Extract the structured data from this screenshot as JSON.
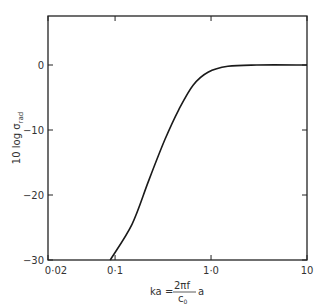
{
  "chart_data": {
    "type": "line",
    "title": "",
    "xlabel": "ka = (2πf / c0) a",
    "ylabel": "10 log σrad",
    "xscale": "log",
    "xlim": [
      0.02,
      10
    ],
    "ylim": [
      -30,
      7.5
    ],
    "grid": false,
    "legend": null,
    "x_ticks": [
      {
        "value": 0.02,
        "label": "0·02"
      },
      {
        "value": 0.1,
        "label": "0·1"
      },
      {
        "value": 1.0,
        "label": "1·0"
      },
      {
        "value": 10,
        "label": "10"
      }
    ],
    "y_ticks": [
      {
        "value": 0,
        "label": "0"
      },
      {
        "value": -10,
        "label": "-10"
      },
      {
        "value": -20,
        "label": "-20"
      },
      {
        "value": -30,
        "label": "-30"
      }
    ],
    "series": [
      {
        "name": "radiation efficiency",
        "x": [
          0.089,
          0.15,
          0.225,
          0.33,
          0.46,
          0.65,
          0.93,
          1.5,
          3.0,
          10
        ],
        "y": [
          -30,
          -24.5,
          -17.7,
          -11.5,
          -6.9,
          -3.1,
          -1.1,
          -0.2,
          0,
          0
        ]
      }
    ]
  },
  "labels": {
    "ylabel_main": "10 log σ",
    "ylabel_sub": "rad",
    "xlabel_left": "ka =",
    "xlabel_num": "2πf",
    "xlabel_den": "c",
    "xlabel_den_sub": "0",
    "xlabel_right": "a"
  },
  "style": {
    "line_color": "#1a1a1a",
    "axis_color": "#222222",
    "background": "#ffffff"
  }
}
